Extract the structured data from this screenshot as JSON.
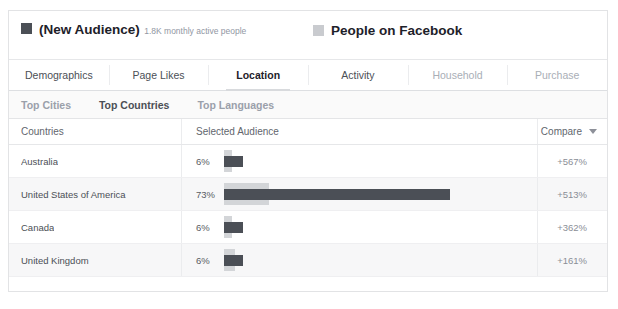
{
  "card": {
    "legend": {
      "primary": {
        "swatch_color": "#4b4f56",
        "title": "(New Audience)",
        "subtitle": "1.8K monthly active people"
      },
      "secondary": {
        "swatch_color": "#c9cbcf",
        "title": "People on Facebook"
      }
    },
    "main_tabs": [
      {
        "label": "Demographics",
        "active": false,
        "muted": false
      },
      {
        "label": "Page Likes",
        "active": false,
        "muted": false
      },
      {
        "label": "Location",
        "active": true,
        "muted": false
      },
      {
        "label": "Activity",
        "active": false,
        "muted": false
      },
      {
        "label": "Household",
        "active": false,
        "muted": true
      },
      {
        "label": "Purchase",
        "active": false,
        "muted": true
      }
    ],
    "sub_tabs": [
      {
        "label": "Top Cities",
        "active": false
      },
      {
        "label": "Top Countries",
        "active": true
      },
      {
        "label": "Top Languages",
        "active": false
      }
    ],
    "table": {
      "headers": {
        "country": "Countries",
        "audience": "Selected Audience",
        "compare": "Compare"
      },
      "rows": [
        {
          "country": "Australia",
          "percent_label": "6%",
          "selected_pct": 6,
          "compare_pct": 1,
          "compare_label": "+567%"
        },
        {
          "country": "United States of America",
          "percent_label": "73%",
          "selected_pct": 73,
          "compare_pct": 13,
          "compare_label": "+513%"
        },
        {
          "country": "Canada",
          "percent_label": "6%",
          "selected_pct": 6,
          "compare_pct": 1,
          "compare_label": "+362%"
        },
        {
          "country": "United Kingdom",
          "percent_label": "6%",
          "selected_pct": 6,
          "compare_pct": 2,
          "compare_label": "+161%"
        }
      ]
    }
  },
  "chart_data": {
    "type": "bar",
    "categories": [
      "Australia",
      "United States of America",
      "Canada",
      "United Kingdom"
    ],
    "series": [
      {
        "name": "(New Audience)",
        "values": [
          6,
          73,
          6,
          6
        ],
        "color": "#4b4f56"
      },
      {
        "name": "People on Facebook",
        "values": [
          1,
          13,
          1,
          2
        ],
        "color": "#d3d5d8"
      }
    ],
    "value_labels": [
      "6%",
      "73%",
      "6%",
      "6%"
    ],
    "compare_values": [
      "+567%",
      "+513%",
      "+362%",
      "+161%"
    ],
    "xlabel": "",
    "ylabel": "Countries",
    "xlim": [
      0,
      100
    ],
    "grid": false,
    "legend_position": "top"
  }
}
